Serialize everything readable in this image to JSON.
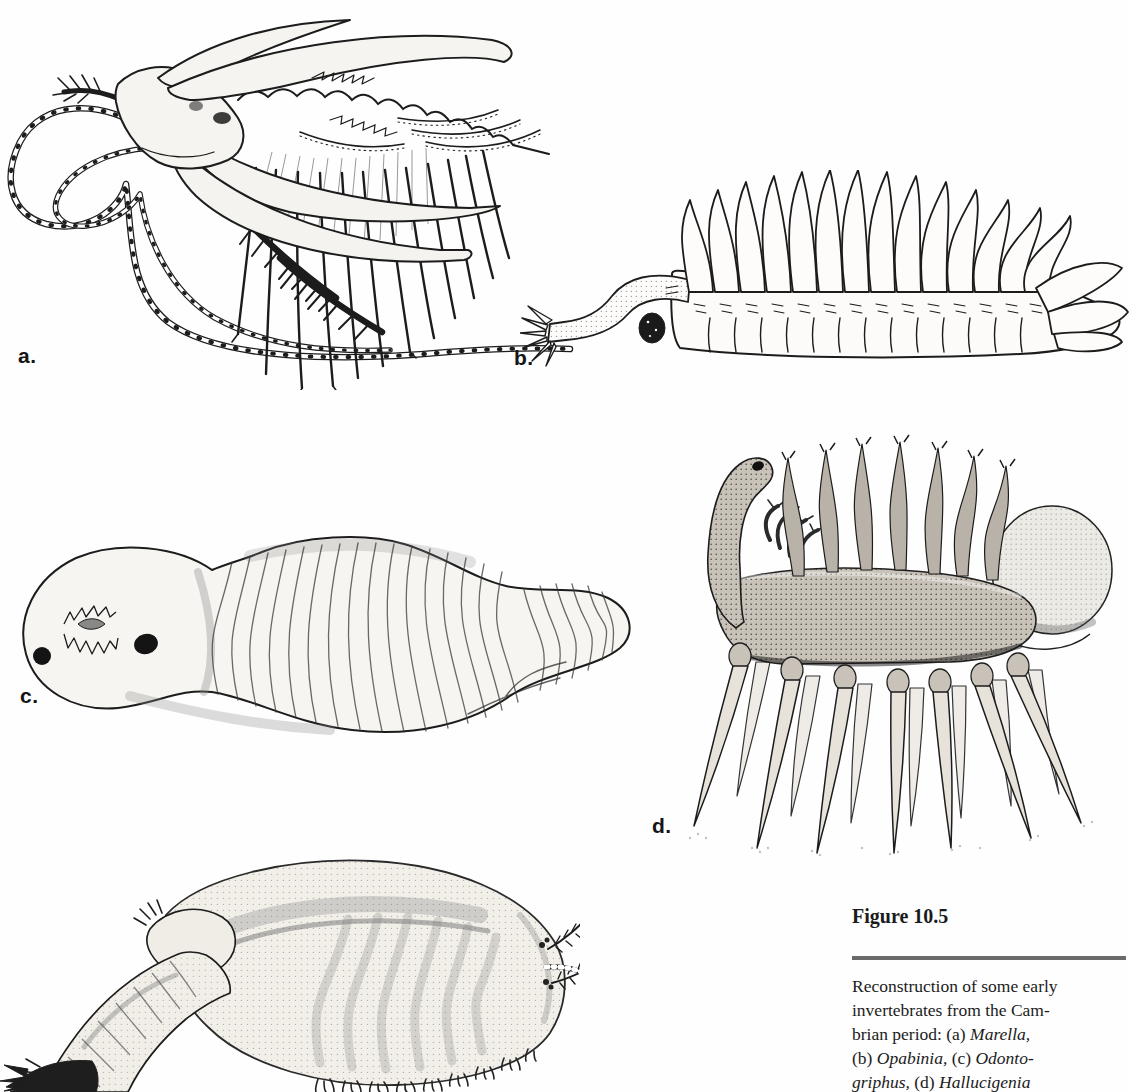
{
  "colors": {
    "ink": "#1c1c1c",
    "paper": "#fefefe",
    "caption_rule": "#6a6a6a"
  },
  "panels": [
    {
      "label": "a."
    },
    {
      "label": "b."
    },
    {
      "label": "c."
    },
    {
      "label": "d."
    }
  ],
  "caption": {
    "title": "Figure 10.5",
    "lines": [
      {
        "parts": [
          {
            "t": "Reconstruction of some early"
          }
        ]
      },
      {
        "parts": [
          {
            "t": "invertebrates from the Cam-"
          }
        ]
      },
      {
        "parts": [
          {
            "t": "brian period: (a) "
          },
          {
            "t": "Marella,"
          }
        ]
      },
      {
        "parts": [
          {
            "t": "(b) "
          },
          {
            "t": "Opabinia,"
          },
          {
            "t": " (c) "
          },
          {
            "t": "Odonto-"
          }
        ]
      },
      {
        "parts": [
          {
            "t": "griphus,"
          },
          {
            "t": " (d) "
          },
          {
            "t": "Hallucigenia"
          }
        ]
      }
    ]
  }
}
